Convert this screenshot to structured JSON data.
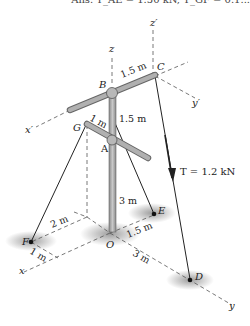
{
  "header": {
    "answer_text": "Ans. T_AE = 1.50 kN, T_GF = 0.1..."
  },
  "labels": {
    "z": "z",
    "z_prime": "z′",
    "y_prime": "y′",
    "x_prime": "x′",
    "x": "x",
    "y": "y",
    "B": "B",
    "C": "C",
    "G": "G",
    "A": "A",
    "E": "E",
    "F": "F",
    "O": "O",
    "D": "D"
  },
  "dimensions": {
    "BC": "1.5 m",
    "AB": "1.5 m",
    "GA": "1 m",
    "OA": "3 m",
    "F_x": "2 m",
    "F_y": "1 m",
    "OE": "1.5 m",
    "OD": "3 m"
  },
  "force": {
    "label": "T = 1.2 kN"
  },
  "colors": {
    "pole": "#a9a9a9",
    "pole_edge": "#6e6e6e",
    "cable": "#222222",
    "shadow": "#8c8c8c",
    "dashed": "#555555"
  }
}
